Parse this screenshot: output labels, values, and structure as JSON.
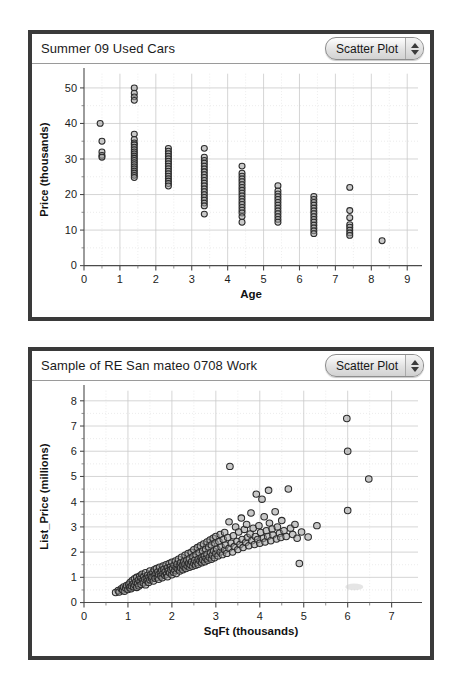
{
  "panels": [
    {
      "id": "cars",
      "title": "Summer 09 Used Cars",
      "plot_type": "Scatter Plot",
      "stepper_up_icon": "triangle-up-icon",
      "stepper_down_icon": "triangle-down-icon"
    },
    {
      "id": "realty",
      "title": "Sample of RE San mateo 0708 Work",
      "plot_type": "Scatter Plot",
      "stepper_up_icon": "triangle-up-icon",
      "stepper_down_icon": "triangle-down-icon"
    }
  ],
  "chart_data": [
    {
      "type": "scatter",
      "title": "Summer 09 Used Cars",
      "xlabel": "Age",
      "ylabel": "Price (thousands)",
      "xlim": [
        0,
        9.3
      ],
      "ylim": [
        0,
        54
      ],
      "xticks": [
        0,
        1,
        2,
        3,
        4,
        5,
        6,
        7,
        8,
        9
      ],
      "yticks": [
        0,
        10,
        20,
        30,
        40,
        50
      ],
      "grid": true,
      "legend": "none",
      "marker": "open-circle",
      "points": [
        [
          0.45,
          40.0
        ],
        [
          0.5,
          35.0
        ],
        [
          0.5,
          32.0
        ],
        [
          0.5,
          31.0
        ],
        [
          0.5,
          30.5
        ],
        [
          1.4,
          50.0
        ],
        [
          1.4,
          48.5
        ],
        [
          1.4,
          47.5
        ],
        [
          1.4,
          46.5
        ],
        [
          1.4,
          37.0
        ],
        [
          1.4,
          35.5
        ],
        [
          1.4,
          34.5
        ],
        [
          1.4,
          34.0
        ],
        [
          1.4,
          33.3
        ],
        [
          1.4,
          32.6
        ],
        [
          1.4,
          32.0
        ],
        [
          1.4,
          31.4
        ],
        [
          1.4,
          30.8
        ],
        [
          1.4,
          30.2
        ],
        [
          1.4,
          29.6
        ],
        [
          1.4,
          29.0
        ],
        [
          1.4,
          28.4
        ],
        [
          1.4,
          27.8
        ],
        [
          1.4,
          27.2
        ],
        [
          1.4,
          26.6
        ],
        [
          1.4,
          26.0
        ],
        [
          1.4,
          25.4
        ],
        [
          1.4,
          24.8
        ],
        [
          2.35,
          33.0
        ],
        [
          2.35,
          32.2
        ],
        [
          2.35,
          31.5
        ],
        [
          2.35,
          30.8
        ],
        [
          2.35,
          30.1
        ],
        [
          2.35,
          29.4
        ],
        [
          2.35,
          28.7
        ],
        [
          2.35,
          28.0
        ],
        [
          2.35,
          27.3
        ],
        [
          2.35,
          26.6
        ],
        [
          2.35,
          25.9
        ],
        [
          2.35,
          25.2
        ],
        [
          2.35,
          24.5
        ],
        [
          2.35,
          23.8
        ],
        [
          2.35,
          23.1
        ],
        [
          2.35,
          22.4
        ],
        [
          3.35,
          33.0
        ],
        [
          3.35,
          30.5
        ],
        [
          3.35,
          29.6
        ],
        [
          3.35,
          28.8
        ],
        [
          3.35,
          28.0
        ],
        [
          3.35,
          27.2
        ],
        [
          3.35,
          26.4
        ],
        [
          3.35,
          25.6
        ],
        [
          3.35,
          24.8
        ],
        [
          3.35,
          24.0
        ],
        [
          3.35,
          23.2
        ],
        [
          3.35,
          22.4
        ],
        [
          3.35,
          21.6
        ],
        [
          3.35,
          20.8
        ],
        [
          3.35,
          20.0
        ],
        [
          3.35,
          19.2
        ],
        [
          3.35,
          18.4
        ],
        [
          3.35,
          17.6
        ],
        [
          3.35,
          16.8
        ],
        [
          3.35,
          14.5
        ],
        [
          4.4,
          28.0
        ],
        [
          4.4,
          26.0
        ],
        [
          4.4,
          25.2
        ],
        [
          4.4,
          24.4
        ],
        [
          4.4,
          23.6
        ],
        [
          4.4,
          22.8
        ],
        [
          4.4,
          22.0
        ],
        [
          4.4,
          21.2
        ],
        [
          4.4,
          20.4
        ],
        [
          4.4,
          19.6
        ],
        [
          4.4,
          18.8
        ],
        [
          4.4,
          18.0
        ],
        [
          4.4,
          17.2
        ],
        [
          4.4,
          16.4
        ],
        [
          4.4,
          15.6
        ],
        [
          4.4,
          14.8
        ],
        [
          4.4,
          13.8
        ],
        [
          4.4,
          12.2
        ],
        [
          5.4,
          22.5
        ],
        [
          5.4,
          21.0
        ],
        [
          5.4,
          20.2
        ],
        [
          5.4,
          19.4
        ],
        [
          5.4,
          18.6
        ],
        [
          5.4,
          17.8
        ],
        [
          5.4,
          17.0
        ],
        [
          5.4,
          16.2
        ],
        [
          5.4,
          15.4
        ],
        [
          5.4,
          14.6
        ],
        [
          5.4,
          13.8
        ],
        [
          5.4,
          13.0
        ],
        [
          5.4,
          12.2
        ],
        [
          6.4,
          19.5
        ],
        [
          6.4,
          18.6
        ],
        [
          6.4,
          17.8
        ],
        [
          6.4,
          17.0
        ],
        [
          6.4,
          16.2
        ],
        [
          6.4,
          15.4
        ],
        [
          6.4,
          14.6
        ],
        [
          6.4,
          13.8
        ],
        [
          6.4,
          13.0
        ],
        [
          6.4,
          12.2
        ],
        [
          6.4,
          11.4
        ],
        [
          6.4,
          10.6
        ],
        [
          6.4,
          9.8
        ],
        [
          6.4,
          9.0
        ],
        [
          7.4,
          22.0
        ],
        [
          7.4,
          15.5
        ],
        [
          7.4,
          13.5
        ],
        [
          7.4,
          11.5
        ],
        [
          7.4,
          10.8
        ],
        [
          7.4,
          10.0
        ],
        [
          7.4,
          9.2
        ],
        [
          7.4,
          8.5
        ],
        [
          8.3,
          7.0
        ]
      ]
    },
    {
      "type": "scatter",
      "title": "Sample of RE San mateo 0708 Work",
      "xlabel": "SqFt (thousands)",
      "ylabel": "List_Price (millions)",
      "xlim": [
        0,
        7.6
      ],
      "ylim": [
        0,
        8.4
      ],
      "xticks": [
        0,
        1,
        2,
        3,
        4,
        5,
        6,
        7
      ],
      "yticks": [
        0,
        1,
        2,
        3,
        4,
        5,
        6,
        7,
        8
      ],
      "grid": true,
      "legend": "none",
      "marker": "open-circle",
      "points": [
        [
          0.72,
          0.4
        ],
        [
          0.78,
          0.48
        ],
        [
          0.8,
          0.42
        ],
        [
          0.85,
          0.55
        ],
        [
          0.88,
          0.5
        ],
        [
          0.9,
          0.62
        ],
        [
          0.92,
          0.45
        ],
        [
          0.95,
          0.58
        ],
        [
          0.97,
          0.68
        ],
        [
          1.0,
          0.52
        ],
        [
          1.02,
          0.72
        ],
        [
          1.04,
          0.6
        ],
        [
          1.05,
          0.8
        ],
        [
          1.07,
          0.55
        ],
        [
          1.08,
          0.66
        ],
        [
          1.1,
          0.88
        ],
        [
          1.12,
          0.74
        ],
        [
          1.13,
          0.62
        ],
        [
          1.15,
          0.95
        ],
        [
          1.16,
          0.7
        ],
        [
          1.18,
          0.82
        ],
        [
          1.2,
          0.6
        ],
        [
          1.2,
          1.0
        ],
        [
          1.22,
          0.76
        ],
        [
          1.24,
          0.9
        ],
        [
          1.25,
          0.66
        ],
        [
          1.27,
          1.05
        ],
        [
          1.28,
          0.84
        ],
        [
          1.3,
          0.72
        ],
        [
          1.3,
          0.98
        ],
        [
          1.32,
          1.12
        ],
        [
          1.34,
          0.88
        ],
        [
          1.35,
          0.78
        ],
        [
          1.36,
          1.02
        ],
        [
          1.38,
          0.92
        ],
        [
          1.4,
          0.7
        ],
        [
          1.4,
          1.18
        ],
        [
          1.42,
          0.96
        ],
        [
          1.44,
          0.86
        ],
        [
          1.45,
          1.08
        ],
        [
          1.47,
          0.8
        ],
        [
          1.48,
          1.0
        ],
        [
          1.5,
          0.9
        ],
        [
          1.5,
          1.25
        ],
        [
          1.52,
          1.1
        ],
        [
          1.54,
          0.95
        ],
        [
          1.55,
          1.02
        ],
        [
          1.57,
          1.2
        ],
        [
          1.58,
          0.85
        ],
        [
          1.6,
          1.3
        ],
        [
          1.6,
          1.05
        ],
        [
          1.62,
          0.96
        ],
        [
          1.64,
          1.15
        ],
        [
          1.65,
          1.35
        ],
        [
          1.67,
          1.0
        ],
        [
          1.68,
          1.22
        ],
        [
          1.7,
          1.1
        ],
        [
          1.7,
          0.92
        ],
        [
          1.72,
          1.4
        ],
        [
          1.74,
          1.18
        ],
        [
          1.75,
          1.05
        ],
        [
          1.77,
          1.28
        ],
        [
          1.78,
          0.98
        ],
        [
          1.8,
          1.45
        ],
        [
          1.8,
          1.15
        ],
        [
          1.82,
          1.32
        ],
        [
          1.84,
          1.08
        ],
        [
          1.85,
          1.22
        ],
        [
          1.87,
          1.5
        ],
        [
          1.88,
          1.12
        ],
        [
          1.9,
          1.38
        ],
        [
          1.9,
          1.02
        ],
        [
          1.92,
          1.25
        ],
        [
          1.94,
          1.55
        ],
        [
          1.95,
          1.18
        ],
        [
          1.97,
          1.42
        ],
        [
          1.98,
          1.3
        ],
        [
          2.0,
          1.1
        ],
        [
          2.0,
          1.6
        ],
        [
          2.02,
          1.35
        ],
        [
          2.04,
          1.2
        ],
        [
          2.05,
          1.48
        ],
        [
          2.07,
          1.28
        ],
        [
          2.08,
          1.65
        ],
        [
          2.1,
          1.4
        ],
        [
          2.1,
          1.15
        ],
        [
          2.12,
          1.52
        ],
        [
          2.14,
          1.32
        ],
        [
          2.15,
          1.72
        ],
        [
          2.17,
          1.45
        ],
        [
          2.18,
          1.25
        ],
        [
          2.2,
          1.58
        ],
        [
          2.2,
          1.38
        ],
        [
          2.22,
          1.8
        ],
        [
          2.24,
          1.48
        ],
        [
          2.25,
          1.3
        ],
        [
          2.27,
          1.62
        ],
        [
          2.28,
          1.42
        ],
        [
          2.3,
          1.88
        ],
        [
          2.3,
          1.52
        ],
        [
          2.32,
          1.35
        ],
        [
          2.34,
          1.68
        ],
        [
          2.35,
          1.46
        ],
        [
          2.37,
          1.95
        ],
        [
          2.38,
          1.56
        ],
        [
          2.4,
          1.4
        ],
        [
          2.4,
          1.74
        ],
        [
          2.42,
          1.5
        ],
        [
          2.44,
          2.0
        ],
        [
          2.45,
          1.62
        ],
        [
          2.47,
          1.44
        ],
        [
          2.48,
          1.82
        ],
        [
          2.5,
          1.55
        ],
        [
          2.5,
          2.1
        ],
        [
          2.52,
          1.68
        ],
        [
          2.54,
          1.48
        ],
        [
          2.55,
          1.9
        ],
        [
          2.57,
          1.6
        ],
        [
          2.58,
          2.18
        ],
        [
          2.6,
          1.72
        ],
        [
          2.6,
          1.52
        ],
        [
          2.62,
          1.98
        ],
        [
          2.64,
          1.65
        ],
        [
          2.65,
          2.25
        ],
        [
          2.67,
          1.78
        ],
        [
          2.68,
          1.58
        ],
        [
          2.7,
          2.05
        ],
        [
          2.7,
          1.7
        ],
        [
          2.72,
          2.32
        ],
        [
          2.74,
          1.85
        ],
        [
          2.75,
          1.62
        ],
        [
          2.77,
          2.12
        ],
        [
          2.78,
          1.75
        ],
        [
          2.8,
          2.4
        ],
        [
          2.8,
          1.92
        ],
        [
          2.82,
          1.68
        ],
        [
          2.84,
          2.2
        ],
        [
          2.85,
          1.8
        ],
        [
          2.87,
          2.48
        ],
        [
          2.88,
          1.98
        ],
        [
          2.9,
          1.72
        ],
        [
          2.9,
          2.28
        ],
        [
          2.92,
          1.88
        ],
        [
          2.94,
          2.55
        ],
        [
          2.95,
          2.05
        ],
        [
          2.97,
          1.78
        ],
        [
          2.98,
          2.35
        ],
        [
          3.0,
          1.95
        ],
        [
          3.0,
          2.62
        ],
        [
          3.02,
          2.12
        ],
        [
          3.05,
          1.85
        ],
        [
          3.07,
          2.42
        ],
        [
          3.1,
          2.0
        ],
        [
          3.1,
          2.7
        ],
        [
          3.12,
          2.2
        ],
        [
          3.15,
          1.9
        ],
        [
          3.17,
          2.5
        ],
        [
          3.2,
          2.08
        ],
        [
          3.2,
          2.78
        ],
        [
          3.22,
          2.28
        ],
        [
          3.25,
          1.95
        ],
        [
          3.27,
          2.58
        ],
        [
          3.3,
          2.15
        ],
        [
          3.3,
          3.2
        ],
        [
          3.32,
          5.4
        ],
        [
          3.35,
          2.35
        ],
        [
          3.38,
          2.0
        ],
        [
          3.4,
          2.65
        ],
        [
          3.42,
          2.22
        ],
        [
          3.45,
          3.0
        ],
        [
          3.48,
          2.42
        ],
        [
          3.5,
          2.1
        ],
        [
          3.52,
          2.8
        ],
        [
          3.55,
          2.3
        ],
        [
          3.58,
          3.35
        ],
        [
          3.6,
          2.5
        ],
        [
          3.62,
          2.18
        ],
        [
          3.65,
          2.9
        ],
        [
          3.68,
          2.38
        ],
        [
          3.7,
          3.1
        ],
        [
          3.72,
          2.58
        ],
        [
          3.75,
          2.25
        ],
        [
          3.78,
          2.72
        ],
        [
          3.8,
          3.55
        ],
        [
          3.82,
          2.45
        ],
        [
          3.85,
          2.95
        ],
        [
          3.88,
          2.3
        ],
        [
          3.9,
          2.62
        ],
        [
          3.92,
          4.3
        ],
        [
          3.95,
          2.5
        ],
        [
          3.98,
          3.05
        ],
        [
          4.0,
          2.35
        ],
        [
          4.02,
          2.78
        ],
        [
          4.05,
          4.1
        ],
        [
          4.08,
          2.55
        ],
        [
          4.1,
          3.4
        ],
        [
          4.12,
          2.4
        ],
        [
          4.15,
          2.85
        ],
        [
          4.18,
          2.62
        ],
        [
          4.2,
          4.45
        ],
        [
          4.22,
          3.15
        ],
        [
          4.25,
          2.45
        ],
        [
          4.28,
          2.92
        ],
        [
          4.3,
          2.68
        ],
        [
          4.35,
          3.6
        ],
        [
          4.38,
          2.52
        ],
        [
          4.4,
          3.0
        ],
        [
          4.45,
          2.75
        ],
        [
          4.48,
          2.58
        ],
        [
          4.5,
          3.25
        ],
        [
          4.55,
          2.85
        ],
        [
          4.6,
          2.62
        ],
        [
          4.65,
          4.5
        ],
        [
          4.7,
          2.95
        ],
        [
          4.75,
          2.7
        ],
        [
          4.8,
          3.1
        ],
        [
          4.85,
          2.55
        ],
        [
          4.9,
          1.55
        ],
        [
          4.95,
          2.8
        ],
        [
          5.1,
          2.6
        ],
        [
          5.3,
          3.05
        ],
        [
          5.98,
          7.3
        ],
        [
          6.0,
          6.0
        ],
        [
          6.0,
          3.65
        ],
        [
          6.48,
          4.9
        ]
      ]
    }
  ]
}
